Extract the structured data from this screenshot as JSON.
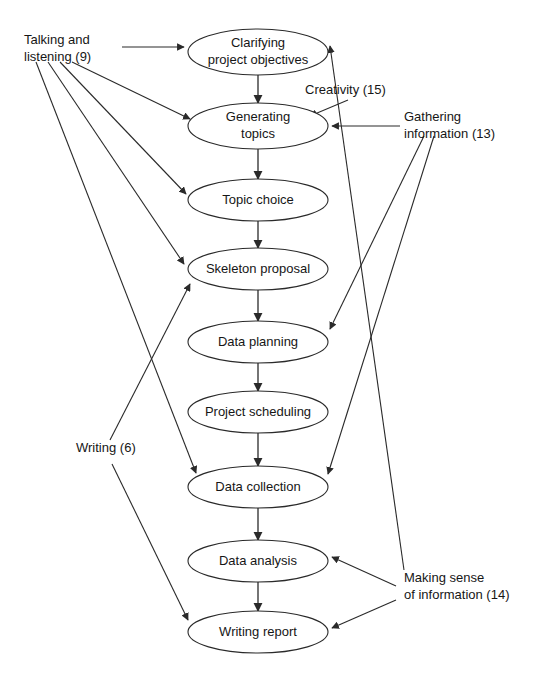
{
  "diagram": {
    "background_color": "#ffffff",
    "line_color": "#2a2a2a",
    "text_color": "#161616",
    "nodes": [
      {
        "id": "clarifying",
        "label_line1": "Clarifying",
        "label_line2": "project objectives",
        "cx": 258,
        "cy": 52,
        "rx": 70,
        "ry": 23
      },
      {
        "id": "generating",
        "label_line1": "Generating",
        "label_line2": "topics",
        "cx": 258,
        "cy": 126,
        "rx": 70,
        "ry": 23
      },
      {
        "id": "topic",
        "label_line1": "Topic choice",
        "label_line2": "",
        "cx": 258,
        "cy": 200,
        "rx": 70,
        "ry": 21
      },
      {
        "id": "skeleton",
        "label_line1": "Skeleton proposal",
        "label_line2": "",
        "cx": 258,
        "cy": 269,
        "rx": 70,
        "ry": 21
      },
      {
        "id": "planning",
        "label_line1": "Data planning",
        "label_line2": "",
        "cx": 258,
        "cy": 342,
        "rx": 70,
        "ry": 21
      },
      {
        "id": "scheduling",
        "label_line1": "Project scheduling",
        "label_line2": "",
        "cx": 258,
        "cy": 412,
        "rx": 70,
        "ry": 21
      },
      {
        "id": "collection",
        "label_line1": "Data collection",
        "label_line2": "",
        "cx": 258,
        "cy": 487,
        "rx": 70,
        "ry": 21
      },
      {
        "id": "analysis",
        "label_line1": "Data analysis",
        "label_line2": "",
        "cx": 258,
        "cy": 561,
        "rx": 70,
        "ry": 21
      },
      {
        "id": "report",
        "label_line1": "Writing report",
        "label_line2": "",
        "cx": 258,
        "cy": 632,
        "rx": 70,
        "ry": 21
      }
    ],
    "side_labels": [
      {
        "id": "talking",
        "line1": "Talking and",
        "line2": "listening (9)",
        "x": 24,
        "y": 44,
        "anchor": "start"
      },
      {
        "id": "creativity",
        "line1": "Creativity (15)",
        "line2": "",
        "x": 305,
        "y": 94,
        "anchor": "start"
      },
      {
        "id": "gathering",
        "line1": "Gathering",
        "line2": "information (13)",
        "x": 404,
        "y": 121,
        "anchor": "start"
      },
      {
        "id": "writing",
        "line1": "Writing (6)",
        "line2": "",
        "x": 76,
        "y": 452,
        "anchor": "start"
      },
      {
        "id": "making",
        "line1": "Making sense",
        "line2": "of information (14)",
        "x": 404,
        "y": 582,
        "anchor": "start"
      }
    ],
    "spine_edges": [
      {
        "from": "clarifying",
        "to": "generating"
      },
      {
        "from": "generating",
        "to": "topic"
      },
      {
        "from": "topic",
        "to": "skeleton"
      },
      {
        "from": "skeleton",
        "to": "planning"
      },
      {
        "from": "planning",
        "to": "scheduling"
      },
      {
        "from": "scheduling",
        "to": "collection"
      },
      {
        "from": "collection",
        "to": "analysis"
      },
      {
        "from": "analysis",
        "to": "report"
      }
    ],
    "influence_edges": [
      {
        "source": "talking",
        "target": "clarifying",
        "x1": 122,
        "y1": 47,
        "x2": 184,
        "y2": 47
      },
      {
        "source": "talking",
        "target": "generating",
        "x1": 72,
        "y1": 62,
        "x2": 190,
        "y2": 119
      },
      {
        "source": "talking",
        "target": "topic",
        "x1": 60,
        "y1": 62,
        "x2": 186,
        "y2": 194
      },
      {
        "source": "talking",
        "target": "skeleton",
        "x1": 48,
        "y1": 62,
        "x2": 184,
        "y2": 264
      },
      {
        "source": "talking",
        "target": "collection",
        "x1": 36,
        "y1": 62,
        "x2": 196,
        "y2": 473
      },
      {
        "source": "creativity",
        "target": "generating",
        "x1": 348,
        "y1": 100,
        "x2": 310,
        "y2": 116
      },
      {
        "source": "gathering",
        "target": "generating",
        "x1": 400,
        "y1": 126,
        "x2": 332,
        "y2": 126
      },
      {
        "source": "gathering",
        "target": "planning",
        "x1": 424,
        "y1": 136,
        "x2": 330,
        "y2": 329
      },
      {
        "source": "gathering",
        "target": "collection",
        "x1": 434,
        "y1": 136,
        "x2": 328,
        "y2": 474
      },
      {
        "source": "writing",
        "target": "skeleton",
        "x1": 110,
        "y1": 440,
        "x2": 190,
        "y2": 284
      },
      {
        "source": "writing",
        "target": "report",
        "x1": 112,
        "y1": 464,
        "x2": 188,
        "y2": 620
      },
      {
        "source": "making",
        "target": "clarifying",
        "x1": 404,
        "y1": 570,
        "x2": 330,
        "y2": 46
      },
      {
        "source": "making",
        "target": "analysis",
        "x1": 396,
        "y1": 586,
        "x2": 332,
        "y2": 557
      },
      {
        "source": "making",
        "target": "report",
        "x1": 396,
        "y1": 600,
        "x2": 332,
        "y2": 628
      }
    ]
  }
}
